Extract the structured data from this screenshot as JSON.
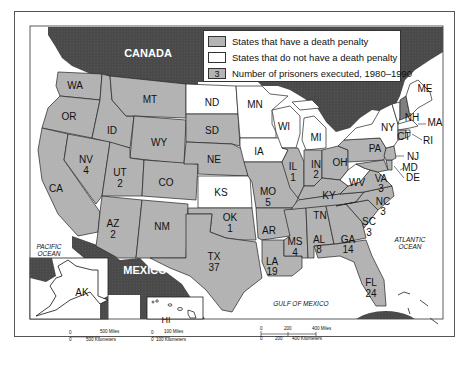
{
  "map": {
    "title_labels": {
      "canada": "CANADA",
      "mexico": "MEXICO",
      "pacific_ocean_1": "PACIFIC",
      "pacific_ocean_2": "OCEAN",
      "atlantic_ocean_1": "ATLANTIC",
      "atlantic_ocean_2": "OCEAN",
      "gulf_of_mexico": "GULF OF MEXICO"
    },
    "legend": {
      "items": [
        {
          "swatch": "",
          "label": "States that have a death penalty",
          "color": "#b4b4b4"
        },
        {
          "swatch": "",
          "label": "States that do not have a death penalty",
          "color": "#ffffff"
        },
        {
          "swatch": "3",
          "label": "Number of prisoners executed, 1980–1990",
          "color": "#b4b4b4"
        }
      ]
    },
    "colors": {
      "death_penalty": "#b4b4b4",
      "no_death_penalty": "#ffffff",
      "foreign_land": "#4a4a4a",
      "water": "#ffffff",
      "border": "#222222"
    },
    "states": [
      {
        "abbr": "WA",
        "count": "",
        "death_penalty": true
      },
      {
        "abbr": "OR",
        "count": "",
        "death_penalty": true
      },
      {
        "abbr": "CA",
        "count": "",
        "death_penalty": true
      },
      {
        "abbr": "ID",
        "count": "",
        "death_penalty": true
      },
      {
        "abbr": "NV",
        "count": "4",
        "death_penalty": true
      },
      {
        "abbr": "MT",
        "count": "",
        "death_penalty": true
      },
      {
        "abbr": "WY",
        "count": "",
        "death_penalty": true
      },
      {
        "abbr": "UT",
        "count": "2",
        "death_penalty": true
      },
      {
        "abbr": "AZ",
        "count": "2",
        "death_penalty": true
      },
      {
        "abbr": "CO",
        "count": "",
        "death_penalty": true
      },
      {
        "abbr": "NM",
        "count": "",
        "death_penalty": true
      },
      {
        "abbr": "ND",
        "count": "",
        "death_penalty": false
      },
      {
        "abbr": "SD",
        "count": "",
        "death_penalty": true
      },
      {
        "abbr": "NE",
        "count": "",
        "death_penalty": true
      },
      {
        "abbr": "KS",
        "count": "",
        "death_penalty": false
      },
      {
        "abbr": "OK",
        "count": "1",
        "death_penalty": true
      },
      {
        "abbr": "TX",
        "count": "37",
        "death_penalty": true
      },
      {
        "abbr": "MN",
        "count": "",
        "death_penalty": false
      },
      {
        "abbr": "IA",
        "count": "",
        "death_penalty": false
      },
      {
        "abbr": "MO",
        "count": "5",
        "death_penalty": true
      },
      {
        "abbr": "AR",
        "count": "",
        "death_penalty": true
      },
      {
        "abbr": "LA",
        "count": "19",
        "death_penalty": true
      },
      {
        "abbr": "WI",
        "count": "",
        "death_penalty": false
      },
      {
        "abbr": "IL",
        "count": "1",
        "death_penalty": true
      },
      {
        "abbr": "MI",
        "count": "",
        "death_penalty": false
      },
      {
        "abbr": "IN",
        "count": "2",
        "death_penalty": true
      },
      {
        "abbr": "OH",
        "count": "",
        "death_penalty": true
      },
      {
        "abbr": "KY",
        "count": "",
        "death_penalty": true
      },
      {
        "abbr": "TN",
        "count": "",
        "death_penalty": true
      },
      {
        "abbr": "MS",
        "count": "4",
        "death_penalty": true
      },
      {
        "abbr": "AL",
        "count": "8",
        "death_penalty": true
      },
      {
        "abbr": "GA",
        "count": "14",
        "death_penalty": true
      },
      {
        "abbr": "FL",
        "count": "24",
        "death_penalty": true
      },
      {
        "abbr": "SC",
        "count": "3",
        "death_penalty": true
      },
      {
        "abbr": "NC",
        "count": "3",
        "death_penalty": true
      },
      {
        "abbr": "VA",
        "count": "3",
        "death_penalty": true
      },
      {
        "abbr": "WV",
        "count": "",
        "death_penalty": false
      },
      {
        "abbr": "PA",
        "count": "",
        "death_penalty": true
      },
      {
        "abbr": "NY",
        "count": "",
        "death_penalty": false
      },
      {
        "abbr": "MD",
        "count": "",
        "death_penalty": true
      },
      {
        "abbr": "DE",
        "count": "",
        "death_penalty": true
      },
      {
        "abbr": "NJ",
        "count": "",
        "death_penalty": true
      },
      {
        "abbr": "CT",
        "count": "",
        "death_penalty": true
      },
      {
        "abbr": "RI",
        "count": "",
        "death_penalty": false
      },
      {
        "abbr": "MA",
        "count": "",
        "death_penalty": false
      },
      {
        "abbr": "VT",
        "count": "",
        "death_penalty": false
      },
      {
        "abbr": "NH",
        "count": "",
        "death_penalty": true
      },
      {
        "abbr": "ME",
        "count": "",
        "death_penalty": false
      },
      {
        "abbr": "AK",
        "count": "",
        "death_penalty": false
      },
      {
        "abbr": "HI",
        "count": "",
        "death_penalty": false
      }
    ],
    "scale_bars": {
      "main": {
        "miles_0": "0",
        "miles_1": "200",
        "miles_2": "400 Miles",
        "km_0": "0",
        "km_1": "200",
        "km_2": "400 Kilometers"
      },
      "alaska": {
        "miles_0": "0",
        "miles_1": "500 Miles",
        "km_0": "0",
        "km_1": "500 Kilometers"
      },
      "hawaii": {
        "miles_0": "0",
        "miles_1": "100 Miles",
        "km_0": "0",
        "km_1": "100 Kilometers"
      }
    }
  }
}
